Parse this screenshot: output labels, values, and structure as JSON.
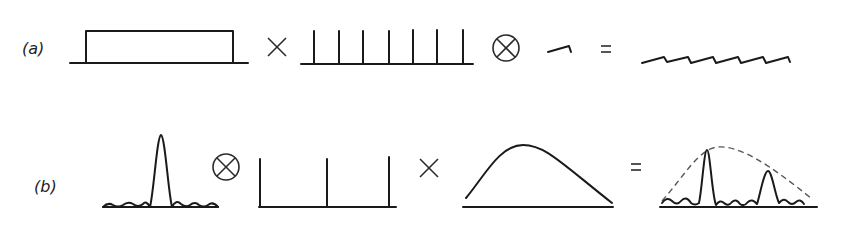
{
  "diagram": {
    "row_a": {
      "label": "(a)",
      "operators": {
        "multiply": "×",
        "convolve": "⊗",
        "equals": "="
      },
      "elements": [
        {
          "name": "rectangle-function",
          "description": "rect window"
        },
        {
          "name": "dirac-comb",
          "teeth": 7
        },
        {
          "name": "small-sawtooth-kernel"
        },
        {
          "name": "sawtooth-train",
          "teeth": 7
        }
      ]
    },
    "row_b": {
      "label": "(b)",
      "operators": {
        "convolve": "⊗",
        "multiply": "×",
        "equals": "="
      },
      "elements": [
        {
          "name": "sinc-function"
        },
        {
          "name": "dirac-comb",
          "teeth": 3
        },
        {
          "name": "envelope-function"
        },
        {
          "name": "result-peaks-with-dashed-envelope",
          "peaks": 2
        }
      ]
    },
    "colors": {
      "line": "#1a1a1a",
      "dashed_envelope": "#555555",
      "background": "#ffffff"
    }
  }
}
